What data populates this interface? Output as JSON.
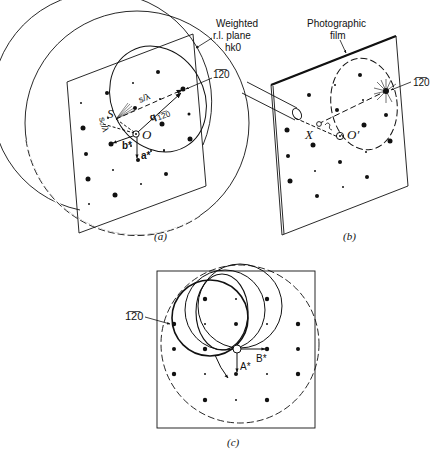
{
  "panels": {
    "a": {
      "caption": "(a)",
      "plane_label_line1": "Weighted",
      "plane_label_line2": "r.l. plane",
      "plane_label_line3": "hk0",
      "reflection_label": "1̅2̅0",
      "point_S": "S",
      "point_O": "O",
      "vector_s": "s/λ",
      "vector_s0": "s₀/λ",
      "vector_q": "q",
      "vector_q_sub": "1̅2̅0",
      "axis_a": "a*",
      "axis_b": "b*"
    },
    "b": {
      "caption": "(b)",
      "film_label_line1": "Photographic",
      "film_label_line2": "film",
      "reflection_label": "1̅2̅0",
      "point_X": "X",
      "point_O": "O′"
    },
    "c": {
      "caption": "(c)",
      "reflection_label": "1̅2̅0",
      "axis_A": "A*",
      "axis_B": "B*"
    }
  },
  "colors": {
    "ink": "#111111",
    "background": "#ffffff"
  }
}
